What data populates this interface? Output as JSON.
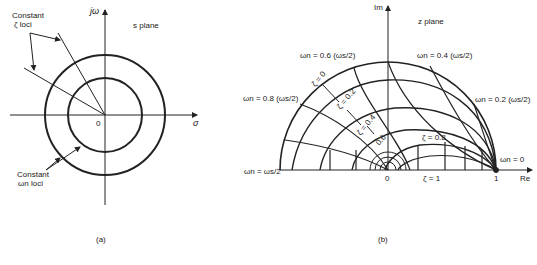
{
  "domain": "Diagram",
  "panel_a": {
    "caption": "(a)",
    "plane_label": "s plane",
    "y_axis_label": "jω",
    "x_axis_label": "σ",
    "origin_label": "0",
    "zeta_annotation": [
      "Constant",
      "ζ loci"
    ],
    "omega_annotation": [
      "Constant",
      "ωn loci"
    ]
  },
  "panel_b": {
    "caption": "(b)",
    "plane_label": "z plane",
    "y_axis_label": "Im",
    "x_axis_label": "Re",
    "origin_label": "0",
    "one_label": "1",
    "zeta_labels": [
      "ζ = 0",
      "ζ = 0.2",
      "ζ = 0.4",
      "0.6",
      "ζ = 0.8",
      "ζ = 1"
    ],
    "omega_labels": {
      "w06": "ωn = 0.6 (ωs/2)",
      "w08": "ωn = 0.8 (ωs/2)",
      "w10": "ωn = ωs/2",
      "w04": "ωn = 0.4 (ωs/2)",
      "w02": "ωn = 0.2 (ωs/2)",
      "w00": "ωn = 0"
    }
  }
}
